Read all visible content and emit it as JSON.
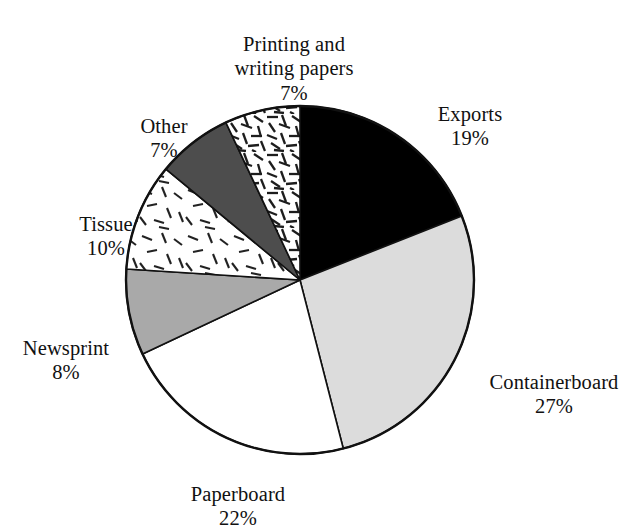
{
  "chart_data": {
    "type": "pie",
    "title": "",
    "subtitle": "",
    "xlabel": "",
    "ylabel": "",
    "legend_position": "none",
    "grid": false,
    "labels_outside": true,
    "value_suffix": "%",
    "start_angle_deg": 0,
    "direction": "clockwise",
    "categories": [
      "Exports",
      "Containerboard",
      "Paperboard",
      "Newsprint",
      "Tissue",
      "Other",
      "Printing and writing papers"
    ],
    "values": [
      19,
      27,
      22,
      8,
      10,
      7,
      7
    ],
    "slices": [
      {
        "name": "Exports",
        "label": "Exports",
        "percent": 19,
        "percent_text": "19%",
        "fill": "#000000",
        "pattern": "solid-black",
        "start_deg": 0,
        "end_deg": 68.4
      },
      {
        "name": "Containerboard",
        "label": "Containerboard",
        "percent": 27,
        "percent_text": "27%",
        "fill": "#dcdcdc",
        "pattern": "solid-light-gray",
        "start_deg": 68.4,
        "end_deg": 165.6
      },
      {
        "name": "Paperboard",
        "label": "Paperboard",
        "percent": 22,
        "percent_text": "22%",
        "fill": "#ffffff",
        "pattern": "solid-white",
        "start_deg": 165.6,
        "end_deg": 244.8
      },
      {
        "name": "Newsprint",
        "label": "Newsprint",
        "percent": 8,
        "percent_text": "8%",
        "fill": "#a9a9a9",
        "pattern": "solid-medium-gray",
        "start_deg": 244.8,
        "end_deg": 273.6
      },
      {
        "name": "Tissue",
        "label": "Tissue",
        "percent": 10,
        "percent_text": "10%",
        "fill": "#ffffff",
        "pattern": "sparse-dashes",
        "start_deg": 273.6,
        "end_deg": 309.6
      },
      {
        "name": "Other",
        "label": "Other",
        "percent": 7,
        "percent_text": "7%",
        "fill": "#4d4d4d",
        "pattern": "solid-dark-gray",
        "start_deg": 309.6,
        "end_deg": 334.8
      },
      {
        "name": "Printing and writing papers",
        "label": "Printing and\nwriting papers",
        "percent": 7,
        "percent_text": "7%",
        "fill": "#ffffff",
        "pattern": "dense-random-hatch",
        "start_deg": 334.8,
        "end_deg": 360
      }
    ],
    "colors": {
      "exports": "#000000",
      "containerboard": "#dcdcdc",
      "paperboard": "#ffffff",
      "newsprint": "#a9a9a9",
      "tissue": "#ffffff",
      "other": "#4d4d4d",
      "printing_and_writing_papers": "#ffffff",
      "outline": "#111111",
      "background": "#ffffff"
    },
    "geometry": {
      "center_x": 300,
      "center_y": 280,
      "radius": 174
    }
  }
}
